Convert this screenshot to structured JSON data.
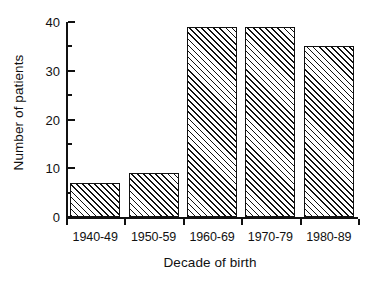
{
  "chart_data": {
    "type": "bar",
    "title": "",
    "xlabel": "Decade of birth",
    "ylabel": "Number of patients",
    "categories": [
      "1940-49",
      "1950-59",
      "1960-69",
      "1970-79",
      "1980-89"
    ],
    "values": [
      7,
      9,
      39,
      39,
      35
    ],
    "ylim": [
      0,
      40
    ],
    "ytick_major": [
      0,
      10,
      20,
      30,
      40
    ],
    "ytick_minor": [
      5,
      15,
      25,
      35
    ],
    "ytick_labels": [
      "0",
      "10",
      "20",
      "30",
      "40"
    ],
    "grid": false,
    "legend": null,
    "bar_fill": "diagonal-hatch",
    "bar_edge_color": "#111111",
    "background_color": "#ffffff",
    "axis_color": "#111111"
  },
  "axes": {
    "y_title": "Number of patients",
    "x_title": "Decade of birth"
  }
}
